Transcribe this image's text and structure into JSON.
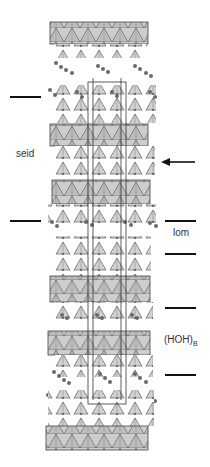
{
  "figure": {
    "labels": {
      "seid": "seid",
      "lom": "lom",
      "hoh_main": "(HOH)",
      "hoh_sub": "B"
    },
    "left_markers_y": [
      97,
      221
    ],
    "right_markers_y": [
      221,
      254,
      308,
      375
    ],
    "arrow": {
      "y": 162,
      "direction": "left"
    },
    "colors": {
      "polyhedra_fill": "#c8c8c8",
      "polyhedra_dark": "#a8a8a8",
      "edge": "#444444",
      "atom": "#6a6a6a",
      "marker": "#111111"
    }
  }
}
